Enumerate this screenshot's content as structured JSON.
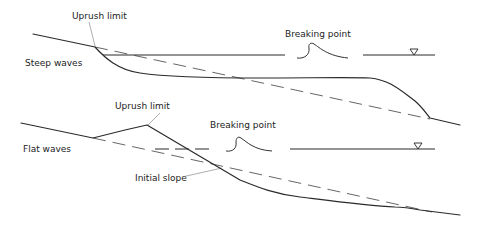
{
  "diagram": {
    "panels": [
      {
        "id": "steep",
        "label": "Steep waves",
        "annotations": {
          "uprush": "Uprush limit",
          "breaking": "Breaking point"
        },
        "water_level_symbol": "▽"
      },
      {
        "id": "flat",
        "label": "Flat waves",
        "annotations": {
          "uprush": "Uprush limit",
          "breaking": "Breaking point",
          "initial_slope": "Initial slope"
        },
        "water_level_symbol": "▽"
      }
    ],
    "legend": {
      "solid_line": "Beach profile after wave action",
      "dashed_line": "Initial slope"
    }
  }
}
